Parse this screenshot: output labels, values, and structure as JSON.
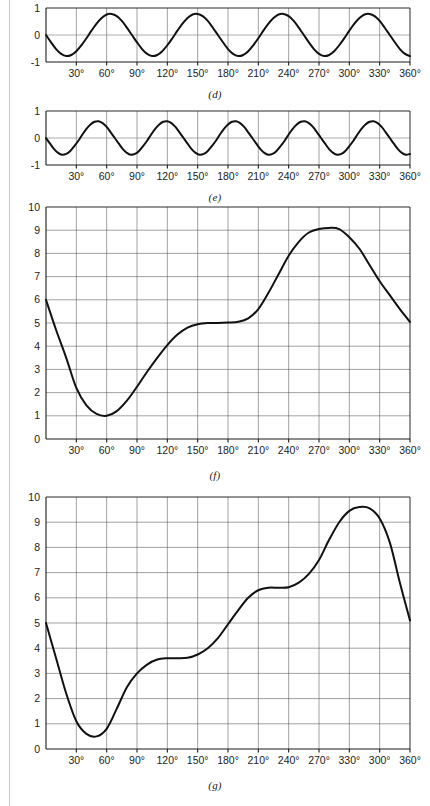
{
  "page": {
    "background": "#ffffff",
    "ink": "#111111",
    "grid_color": "#555555"
  },
  "figures": [
    {
      "id": "d",
      "caption": "(d)",
      "chart_data": {
        "type": "line",
        "title": "",
        "xlabel": "",
        "ylabel": "",
        "xlim": [
          0,
          360
        ],
        "ylim": [
          -1,
          1
        ],
        "grid": true,
        "legend": null,
        "yticks": [
          "1",
          "0",
          "-1"
        ],
        "ytick_values": [
          1,
          0,
          -1
        ],
        "xticks": [
          "30°",
          "60°",
          "90°",
          "120°",
          "150°",
          "180°",
          "210°",
          "240°",
          "270°",
          "300°",
          "330°",
          "360°"
        ],
        "xtick_values": [
          30,
          60,
          90,
          120,
          150,
          180,
          210,
          240,
          270,
          300,
          330,
          360
        ],
        "series": [
          {
            "name": "fourth harmonic",
            "description": "negative sine, 4 cycles over 360 degrees",
            "amplitude": 0.78,
            "period_deg": 90,
            "phase_deg": 180,
            "x": [
              0,
              5,
              10,
              15,
              20,
              25,
              30,
              35,
              40,
              45,
              50,
              55,
              60,
              65,
              70,
              75,
              80,
              85,
              90,
              95,
              100,
              105,
              110,
              115,
              120,
              125,
              130,
              135,
              140,
              145,
              150,
              155,
              160,
              165,
              170,
              175,
              180,
              185,
              190,
              195,
              200,
              205,
              210,
              215,
              220,
              225,
              230,
              235,
              240,
              245,
              250,
              255,
              260,
              265,
              270,
              275,
              280,
              285,
              290,
              295,
              300,
              305,
              310,
              315,
              320,
              325,
              330,
              335,
              340,
              345,
              350,
              355,
              360
            ],
            "y": [
              0,
              -0.27,
              -0.52,
              -0.7,
              -0.78,
              -0.74,
              -0.6,
              -0.38,
              -0.12,
              0.16,
              0.42,
              0.63,
              0.76,
              0.78,
              0.7,
              0.52,
              0.27,
              0,
              -0.27,
              -0.52,
              -0.7,
              -0.78,
              -0.74,
              -0.6,
              -0.38,
              -0.12,
              0.16,
              0.42,
              0.63,
              0.76,
              0.78,
              0.7,
              0.52,
              0.27,
              0,
              -0.27,
              -0.52,
              -0.7,
              -0.78,
              -0.74,
              -0.6,
              -0.38,
              -0.12,
              0.16,
              0.42,
              0.63,
              0.76,
              0.78,
              0.7,
              0.52,
              0.27,
              0,
              -0.27,
              -0.52,
              -0.7,
              -0.78,
              -0.74,
              -0.6,
              -0.38,
              -0.12,
              0.16,
              0.42,
              0.63,
              0.76,
              0.78,
              0.7,
              0.52,
              0.27,
              0,
              -0.27,
              -0.52,
              -0.7,
              -0.78
            ]
          }
        ]
      }
    },
    {
      "id": "e",
      "caption": "(e)",
      "chart_data": {
        "type": "line",
        "title": "",
        "xlabel": "",
        "ylabel": "",
        "xlim": [
          0,
          360
        ],
        "ylim": [
          -1,
          1
        ],
        "grid": true,
        "legend": null,
        "yticks": [
          "1",
          "0",
          "-1"
        ],
        "ytick_values": [
          1,
          0,
          -1
        ],
        "xticks": [
          "30°",
          "60°",
          "90°",
          "120°",
          "150°",
          "180°",
          "210°",
          "240°",
          "270°",
          "300°",
          "330°",
          "360°"
        ],
        "xtick_values": [
          30,
          60,
          90,
          120,
          150,
          180,
          210,
          240,
          270,
          300,
          330,
          360
        ],
        "series": [
          {
            "name": "fifth harmonic",
            "description": "negative sine, 5 cycles over 360 degrees",
            "amplitude": 0.62,
            "period_deg": 72,
            "phase_deg": 180,
            "x": [
              0,
              4,
              8,
              12,
              16,
              20,
              24,
              28,
              32,
              36,
              40,
              44,
              48,
              52,
              56,
              60,
              64,
              68,
              72,
              76,
              80,
              84,
              88,
              92,
              96,
              100,
              104,
              108,
              112,
              116,
              120,
              124,
              128,
              132,
              136,
              140,
              144,
              148,
              152,
              156,
              160,
              164,
              168,
              172,
              176,
              180,
              184,
              188,
              192,
              196,
              200,
              204,
              208,
              212,
              216,
              220,
              224,
              228,
              232,
              236,
              240,
              244,
              248,
              252,
              256,
              260,
              264,
              268,
              272,
              276,
              280,
              284,
              288,
              292,
              296,
              300,
              304,
              308,
              312,
              316,
              320,
              324,
              328,
              332,
              336,
              340,
              344,
              348,
              352,
              356,
              360
            ],
            "y": [
              0,
              -0.21,
              -0.41,
              -0.55,
              -0.62,
              -0.59,
              -0.48,
              -0.3,
              -0.1,
              0.13,
              0.34,
              0.5,
              0.6,
              0.62,
              0.55,
              0.41,
              0.21,
              0,
              -0.21,
              -0.41,
              -0.55,
              -0.62,
              -0.59,
              -0.48,
              -0.3,
              -0.1,
              0.13,
              0.34,
              0.5,
              0.6,
              0.62,
              0.55,
              0.41,
              0.21,
              0,
              -0.21,
              -0.41,
              -0.55,
              -0.62,
              -0.59,
              -0.48,
              -0.3,
              -0.1,
              0.13,
              0.34,
              0.5,
              0.6,
              0.62,
              0.55,
              0.41,
              0.21,
              0,
              -0.21,
              -0.41,
              -0.55,
              -0.62,
              -0.59,
              -0.48,
              -0.3,
              -0.1,
              0.13,
              0.34,
              0.5,
              0.6,
              0.62,
              0.55,
              0.41,
              0.21,
              0,
              -0.21,
              -0.41,
              -0.55,
              -0.62,
              -0.59,
              -0.48,
              -0.3,
              -0.1,
              0.13,
              0.34,
              0.5,
              0.6,
              0.62,
              0.55,
              0.41,
              0.21,
              0,
              -0.21,
              -0.41,
              -0.55,
              -0.62,
              -0.59,
              -0.48
            ]
          }
        ]
      }
    },
    {
      "id": "f",
      "caption": "(f)",
      "chart_data": {
        "type": "line",
        "title": "",
        "xlabel": "",
        "ylabel": "",
        "xlim": [
          0,
          360
        ],
        "ylim": [
          0,
          10
        ],
        "grid": true,
        "legend": null,
        "yticks": [
          "10",
          "9",
          "8",
          "7",
          "6",
          "5",
          "4",
          "3",
          "2",
          "1",
          "0"
        ],
        "ytick_values": [
          10,
          9,
          8,
          7,
          6,
          5,
          4,
          3,
          2,
          1,
          0
        ],
        "xticks": [
          "30°",
          "60°",
          "90°",
          "120°",
          "150°",
          "180°",
          "210°",
          "240°",
          "270°",
          "300°",
          "330°",
          "360°"
        ],
        "xtick_values": [
          30,
          60,
          90,
          120,
          150,
          180,
          210,
          240,
          270,
          300,
          330,
          360
        ],
        "series": [
          {
            "name": "composite waveform f",
            "description": "complex wave; starts 6.0, min 1.0 at 60 deg, plateau 5.0 near 165-195 deg, max 9.1 at 292 deg, ends 5.05",
            "x": [
              0,
              10,
              20,
              30,
              40,
              50,
              60,
              70,
              80,
              90,
              100,
              110,
              120,
              130,
              140,
              150,
              160,
              170,
              180,
              190,
              200,
              210,
              220,
              230,
              240,
              250,
              260,
              270,
              280,
              290,
              300,
              310,
              320,
              330,
              340,
              350,
              360
            ],
            "y": [
              6.0,
              4.7,
              3.5,
              2.2,
              1.45,
              1.08,
              1.0,
              1.2,
              1.65,
              2.25,
              2.9,
              3.5,
              4.05,
              4.5,
              4.8,
              4.95,
              5.0,
              5.0,
              5.02,
              5.05,
              5.2,
              5.6,
              6.3,
              7.1,
              7.9,
              8.5,
              8.9,
              9.05,
              9.1,
              9.05,
              8.7,
              8.2,
              7.5,
              6.8,
              6.2,
              5.6,
              5.05
            ]
          }
        ]
      }
    },
    {
      "id": "g",
      "caption": "(g)",
      "chart_data": {
        "type": "line",
        "title": "",
        "xlabel": "",
        "ylabel": "",
        "xlim": [
          0,
          360
        ],
        "ylim": [
          0,
          10
        ],
        "grid": true,
        "legend": null,
        "yticks": [
          "10",
          "9",
          "8",
          "7",
          "6",
          "5",
          "4",
          "3",
          "2",
          "1",
          "0"
        ],
        "ytick_values": [
          10,
          9,
          8,
          7,
          6,
          5,
          4,
          3,
          2,
          1,
          0
        ],
        "xticks": [
          "30°",
          "60°",
          "90°",
          "120°",
          "150°",
          "180°",
          "210°",
          "240°",
          "270°",
          "330°",
          "300°",
          "360°"
        ],
        "xtick_values": [
          30,
          60,
          90,
          120,
          150,
          180,
          210,
          240,
          270,
          300,
          330,
          360
        ],
        "series": [
          {
            "name": "composite waveform g",
            "description": "complex wave; starts 5.0, min 0.5 at 45 deg, shoulder 3.6 near 115-140 deg, shoulder 6.4 near 205-245 deg, max 9.6 at 320 deg, ends 5.1",
            "x": [
              0,
              10,
              20,
              30,
              40,
              50,
              60,
              70,
              80,
              90,
              100,
              110,
              120,
              130,
              140,
              150,
              160,
              170,
              180,
              190,
              200,
              210,
              220,
              230,
              240,
              250,
              260,
              270,
              280,
              290,
              300,
              310,
              320,
              330,
              340,
              350,
              360
            ],
            "y": [
              5.0,
              3.6,
              2.2,
              1.1,
              0.6,
              0.5,
              0.8,
              1.6,
              2.45,
              3.0,
              3.35,
              3.55,
              3.6,
              3.6,
              3.62,
              3.75,
              4.0,
              4.4,
              4.95,
              5.5,
              6.0,
              6.3,
              6.4,
              6.4,
              6.42,
              6.6,
              6.95,
              7.5,
              8.3,
              9.0,
              9.45,
              9.6,
              9.55,
              9.15,
              8.2,
              6.6,
              5.1
            ]
          }
        ]
      }
    }
  ]
}
